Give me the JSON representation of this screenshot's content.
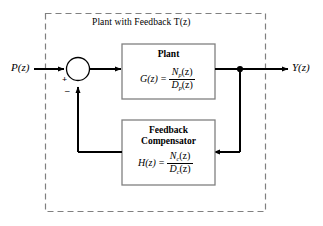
{
  "diagram": {
    "group": {
      "title": "Plant with Feedback T(z)"
    },
    "input": {
      "label": "P(z)"
    },
    "output": {
      "label": "Y(z)"
    },
    "summing_junction": {
      "plus_sign": "+",
      "minus_sign": "–"
    },
    "plant_block": {
      "title": "Plant",
      "lhs": "G(z)",
      "equals": "=",
      "numerator": "N",
      "numerator_sub": "p",
      "numerator_arg": "(z)",
      "denominator": "D",
      "denominator_sub": "p",
      "denominator_arg": "(z)"
    },
    "compensator_block": {
      "title_line1": "Feedback",
      "title_line2": "Compensator",
      "lhs": "H(z)",
      "equals": "=",
      "numerator": "N",
      "numerator_sub": "c",
      "numerator_arg": "(z)",
      "denominator": "D",
      "denominator_sub": "c",
      "denominator_arg": "(z)"
    },
    "colors": {
      "line": "#000000",
      "box_border": "#808080",
      "dashed_border": "#808080",
      "background": "#ffffff"
    }
  }
}
